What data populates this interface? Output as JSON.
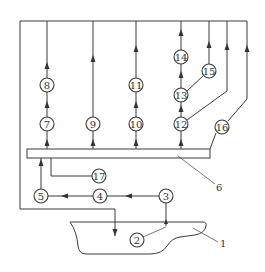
{
  "diagram": {
    "type": "process-flow",
    "colors": {
      "stroke": "#3a3a3a",
      "background": "#ffffff"
    },
    "nodes": [
      {
        "id": "2",
        "label": "2"
      },
      {
        "id": "3",
        "label": "3"
      },
      {
        "id": "4",
        "label": "4"
      },
      {
        "id": "5",
        "label": "5"
      },
      {
        "id": "7",
        "label": "7"
      },
      {
        "id": "8",
        "label": "8"
      },
      {
        "id": "9",
        "label": "9"
      },
      {
        "id": "10",
        "label": "10"
      },
      {
        "id": "11",
        "label": "11"
      },
      {
        "id": "12",
        "label": "12"
      },
      {
        "id": "13",
        "label": "13"
      },
      {
        "id": "14",
        "label": "14"
      },
      {
        "id": "15",
        "label": "15"
      },
      {
        "id": "16",
        "label": "16"
      },
      {
        "id": "17",
        "label": "17"
      }
    ],
    "callouts": [
      {
        "id": "1",
        "label": "1",
        "target": "vessel"
      },
      {
        "id": "6",
        "label": "6",
        "target": "header-bar"
      }
    ],
    "edges": [
      {
        "from": "vessel",
        "to": "3"
      },
      {
        "from": "3",
        "to": "4"
      },
      {
        "from": "4",
        "to": "5"
      },
      {
        "from": "5",
        "to": "header-bar"
      },
      {
        "from": "header-bar",
        "to": "7"
      },
      {
        "from": "7",
        "to": "8"
      },
      {
        "from": "8",
        "to": "top-line"
      },
      {
        "from": "header-bar",
        "to": "9"
      },
      {
        "from": "9",
        "to": "top-line"
      },
      {
        "from": "header-bar",
        "to": "10"
      },
      {
        "from": "10",
        "to": "11"
      },
      {
        "from": "11",
        "to": "top-line"
      },
      {
        "from": "header-bar",
        "to": "12"
      },
      {
        "from": "12",
        "to": "13"
      },
      {
        "from": "13",
        "to": "14"
      },
      {
        "from": "14",
        "to": "top-line"
      },
      {
        "from": "13",
        "to": "15"
      },
      {
        "from": "15",
        "to": "top-line"
      },
      {
        "from": "12",
        "to": "top-line"
      },
      {
        "from": "header-bar",
        "to": "16"
      },
      {
        "from": "16",
        "to": "top-line"
      },
      {
        "from": "header-bar",
        "to": "17"
      },
      {
        "from": "top-line",
        "to": "vessel"
      }
    ]
  }
}
